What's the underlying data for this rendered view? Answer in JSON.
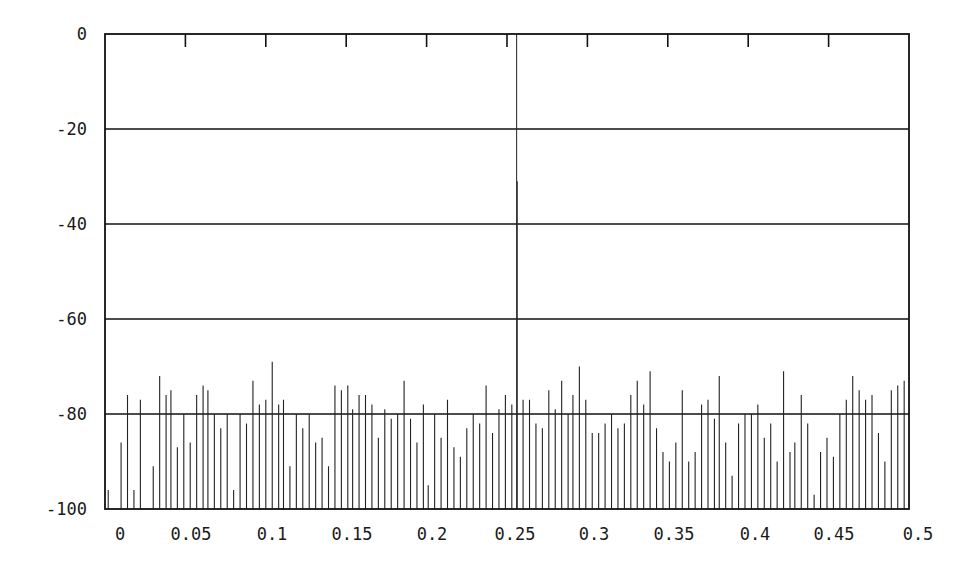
{
  "chart_data": {
    "type": "bar",
    "subtype": "stem / line spectrum",
    "title": "",
    "xlabel": "",
    "ylabel": "",
    "xlim": [
      0,
      0.5
    ],
    "ylim": [
      -100,
      0
    ],
    "grid": {
      "horizontal": true,
      "vertical": false,
      "lines_at_y": [
        -20,
        -40,
        -60,
        -80
      ]
    },
    "legend": null,
    "y_ticks": [
      0,
      -20,
      -40,
      -60,
      -80,
      -100
    ],
    "y_tick_labels": [
      "0",
      "-20",
      "-40",
      "-60",
      "-80",
      "-100"
    ],
    "x_ticks": [
      0,
      0.05,
      0.1,
      0.15,
      0.2,
      0.25,
      0.3,
      0.35,
      0.4,
      0.45,
      0.5
    ],
    "x_tick_labels": [
      "0",
      "0.05",
      "0.1",
      "0.15",
      "0.2",
      "0.25",
      "0.3",
      "0.35",
      "0.4",
      "0.45",
      "0.5"
    ],
    "annotations": [],
    "main_peak": {
      "x": 0.256,
      "y": 0
    },
    "secondary_peak": {
      "x": 0.256,
      "y": -31
    },
    "series": [
      {
        "name": "spectrum",
        "x": [
          0.002,
          0.01,
          0.014,
          0.018,
          0.022,
          0.03,
          0.034,
          0.038,
          0.041,
          0.045,
          0.049,
          0.053,
          0.057,
          0.061,
          0.064,
          0.068,
          0.072,
          0.076,
          0.08,
          0.084,
          0.088,
          0.092,
          0.096,
          0.1,
          0.104,
          0.108,
          0.111,
          0.115,
          0.119,
          0.123,
          0.127,
          0.131,
          0.135,
          0.139,
          0.143,
          0.147,
          0.151,
          0.154,
          0.158,
          0.162,
          0.166,
          0.17,
          0.174,
          0.178,
          0.182,
          0.186,
          0.19,
          0.194,
          0.198,
          0.201,
          0.205,
          0.209,
          0.213,
          0.217,
          0.221,
          0.225,
          0.229,
          0.233,
          0.237,
          0.241,
          0.245,
          0.249,
          0.253,
          0.26,
          0.264,
          0.268,
          0.272,
          0.276,
          0.28,
          0.284,
          0.288,
          0.291,
          0.295,
          0.299,
          0.303,
          0.307,
          0.311,
          0.315,
          0.319,
          0.323,
          0.327,
          0.331,
          0.335,
          0.339,
          0.343,
          0.347,
          0.351,
          0.355,
          0.359,
          0.363,
          0.367,
          0.371,
          0.375,
          0.379,
          0.382,
          0.386,
          0.39,
          0.394,
          0.398,
          0.402,
          0.406,
          0.41,
          0.414,
          0.418,
          0.422,
          0.426,
          0.429,
          0.433,
          0.437,
          0.441,
          0.445,
          0.449,
          0.453,
          0.457,
          0.461,
          0.465,
          0.469,
          0.473,
          0.477,
          0.481,
          0.485,
          0.489,
          0.493,
          0.497
        ],
        "y": [
          -96,
          -86,
          -76,
          -96,
          -77,
          -91,
          -72,
          -76,
          -75,
          -87,
          -80,
          -86,
          -76,
          -74,
          -75,
          -80,
          -83,
          -80,
          -96,
          -80,
          -82,
          -73,
          -78,
          -77,
          -69,
          -78,
          -77,
          -91,
          -80,
          -83,
          -80,
          -86,
          -85,
          -91,
          -74,
          -75,
          -74,
          -79,
          -76,
          -76,
          -78,
          -85,
          -79,
          -81,
          -80,
          -73,
          -81,
          -86,
          -78,
          -95,
          -80,
          -85,
          -77,
          -87,
          -89,
          -83,
          -80,
          -82,
          -74,
          -84,
          -79,
          -76,
          -78,
          -77,
          -77,
          -82,
          -83,
          -75,
          -79,
          -73,
          -80,
          -76,
          -70,
          -77,
          -84,
          -84,
          -82,
          -80,
          -83,
          -82,
          -76,
          -73,
          -78,
          -71,
          -83,
          -88,
          -90,
          -86,
          -75,
          -90,
          -88,
          -78,
          -77,
          -81,
          -72,
          -86,
          -93,
          -82,
          -80,
          -80,
          -78,
          -85,
          -82,
          -90,
          -71,
          -88,
          -86,
          -76,
          -82,
          -97,
          -88,
          -85,
          -89,
          -80,
          -77,
          -72,
          -75,
          -77,
          -76,
          -84,
          -90,
          -75,
          -74,
          -73
        ]
      }
    ]
  }
}
